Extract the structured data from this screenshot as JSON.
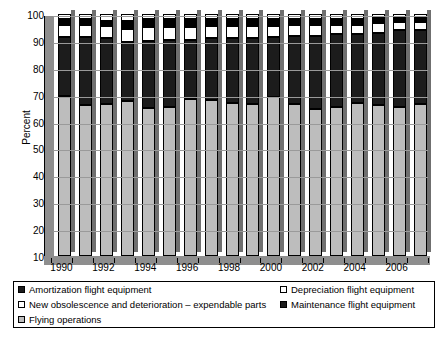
{
  "chart_data": {
    "type": "bar",
    "stacked": true,
    "title": "",
    "subtitle": "",
    "xlabel": "",
    "ylabel": "Percent",
    "ylim": [
      10,
      100
    ],
    "ytick_labels": [
      "100",
      "90",
      "80",
      "70",
      "60",
      "50",
      "40",
      "30",
      "20",
      "10"
    ],
    "ytick_values": [
      100,
      90,
      80,
      70,
      60,
      50,
      40,
      30,
      20,
      10
    ],
    "grid": true,
    "legend_position": "bottom",
    "categories": [
      "1990",
      "1991",
      "1992",
      "1993",
      "1994",
      "1995",
      "1996",
      "1997",
      "1998",
      "1999",
      "2000",
      "2001",
      "2002",
      "2003",
      "2004",
      "2005",
      "2006",
      "2007"
    ],
    "xtick_labels": [
      "1990",
      "1992",
      "1994",
      "1996",
      "1998",
      "2000",
      "2002",
      "2004",
      "2006"
    ],
    "series": [
      {
        "name": "Flying operations",
        "color": "#bdbdbd",
        "values": [
          69.5,
          66.0,
          66.5,
          67.5,
          65.0,
          65.5,
          68.5,
          68.0,
          67.0,
          66.5,
          69.0,
          66.5,
          64.5,
          65.5,
          67.0,
          66.0,
          65.5,
          66.5
        ]
      },
      {
        "name": "Maintenance flight equipment",
        "color": "#1c1c1c",
        "values": [
          22.0,
          25.5,
          24.5,
          22.0,
          25.0,
          25.0,
          22.0,
          23.0,
          24.0,
          24.5,
          22.5,
          25.5,
          27.5,
          27.0,
          25.5,
          27.0,
          28.5,
          27.5
        ]
      },
      {
        "name": "Depreciation flight equipment",
        "color": "#ffffff",
        "values": [
          4.5,
          4.5,
          4.5,
          5.0,
          5.0,
          4.5,
          4.5,
          4.5,
          4.5,
          4.5,
          4.0,
          4.0,
          4.0,
          3.5,
          3.5,
          3.5,
          3.0,
          3.0
        ]
      },
      {
        "name": "Amortization flight equipment",
        "color": "#000000",
        "values": [
          2.0,
          2.0,
          2.0,
          3.0,
          3.0,
          3.0,
          3.0,
          2.5,
          2.5,
          2.5,
          2.5,
          2.0,
          2.0,
          2.0,
          2.0,
          2.0,
          1.5,
          1.5
        ]
      },
      {
        "name": "New obsolescence and deterioration – expendable parts",
        "color": "#ffffff",
        "values": [
          2.0,
          2.0,
          2.5,
          2.5,
          2.0,
          2.0,
          2.0,
          2.0,
          2.0,
          2.0,
          2.0,
          2.0,
          2.0,
          2.0,
          2.0,
          1.5,
          1.5,
          1.5
        ]
      }
    ]
  },
  "axis": {
    "y_title": "Percent"
  },
  "legend": {
    "items": [
      {
        "label": "Amortization flight equipment",
        "swatch": "k-amort"
      },
      {
        "label": "New obsolescence and deterioration – expendable parts",
        "swatch": "k-obso"
      },
      {
        "label": "Flying operations",
        "swatch": "k-flying"
      },
      {
        "label": "Depreciation flight equipment",
        "swatch": "k-depr"
      },
      {
        "label": "Maintenance flight equipment",
        "swatch": "k-maint"
      }
    ]
  }
}
